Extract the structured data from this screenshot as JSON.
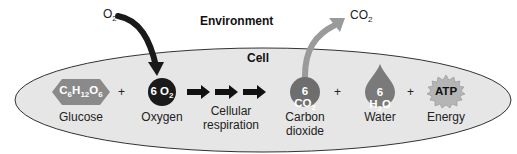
{
  "labels": {
    "environment": "Environment",
    "cell": "Cell",
    "o2_in": "O",
    "o2_in_sub": "2",
    "co2_out": "CO",
    "co2_out_sub": "2"
  },
  "reactants": [
    {
      "formula_parts": [
        "C",
        "6",
        "H",
        "12",
        "O",
        "6"
      ],
      "name": "Glucose",
      "shape": "hexagon",
      "color": "#8a8a8a"
    },
    {
      "formula": "6 O",
      "sub": "2",
      "name": "Oxygen",
      "shape": "circle",
      "color": "#1a1a1a"
    }
  ],
  "process": {
    "name_line1": "Cellular",
    "name_line2": "respiration"
  },
  "products": [
    {
      "formula": "6 CO",
      "sub": "2",
      "name_line1": "Carbon",
      "name_line2": "dioxide",
      "shape": "circle",
      "color": "#6e6e6e"
    },
    {
      "formula": "6 H",
      "sub": "2",
      "formula_tail": "O",
      "name": "Water",
      "shape": "drop",
      "color": "#7a7a7a"
    },
    {
      "formula": "ATP",
      "name": "Energy",
      "shape": "starburst",
      "color": "#b5b5b5"
    }
  ],
  "plus": "+",
  "colors": {
    "cell_fill": "#e6e6e6",
    "cell_stroke": "#333333",
    "co2_arrow": "#9a9a9a",
    "o2_arrow": "#1a1a1a"
  }
}
